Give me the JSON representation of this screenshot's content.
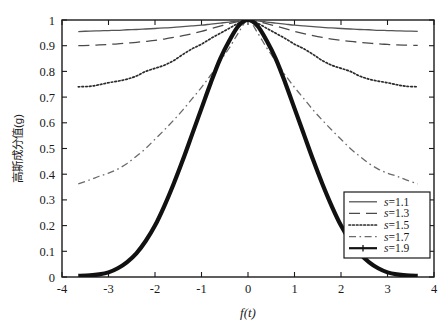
{
  "chart_data": {
    "type": "line",
    "title": "",
    "xlabel": "f(t)",
    "ylabel": "高斯成分值(g)",
    "xlim": [
      -4,
      4
    ],
    "ylim": [
      0,
      1
    ],
    "xticks": [
      "-4",
      "-3",
      "-2",
      "-1",
      "0",
      "1",
      "2",
      "3",
      "4"
    ],
    "xtick_values": [
      -4,
      -3,
      -2,
      -1,
      0,
      1,
      2,
      3,
      4
    ],
    "yticks": [
      "0",
      "0.1",
      "0.2",
      "0.3",
      "0.4",
      "0.5",
      "0.6",
      "0.7",
      "0.8",
      "0.9",
      "1"
    ],
    "ytick_values": [
      0,
      0.1,
      0.2,
      0.3,
      0.4,
      0.5,
      0.6,
      0.7,
      0.8,
      0.9,
      1
    ],
    "grid": false,
    "legend_position": "lower-right",
    "x": [
      -3.65,
      -3.4,
      -3.2,
      -3.0,
      -2.8,
      -2.6,
      -2.4,
      -2.2,
      -2.0,
      -1.8,
      -1.6,
      -1.4,
      -1.2,
      -1.0,
      -0.8,
      -0.6,
      -0.4,
      -0.2,
      0.0,
      0.2,
      0.4,
      0.6,
      0.8,
      1.0,
      1.2,
      1.4,
      1.6,
      1.8,
      2.0,
      2.2,
      2.4,
      2.6,
      2.8,
      3.0,
      3.2,
      3.4,
      3.65
    ],
    "series": [
      {
        "name": "s=1.1",
        "label": "s=1.1",
        "style": "solid",
        "color": "#555555",
        "width": 1.3,
        "values": [
          0.955,
          0.957,
          0.958,
          0.959,
          0.96,
          0.962,
          0.963,
          0.965,
          0.967,
          0.969,
          0.971,
          0.974,
          0.977,
          0.98,
          0.984,
          0.988,
          0.992,
          0.997,
          1.0,
          0.997,
          0.992,
          0.988,
          0.984,
          0.98,
          0.977,
          0.974,
          0.971,
          0.969,
          0.967,
          0.965,
          0.963,
          0.962,
          0.96,
          0.959,
          0.958,
          0.957,
          0.956
        ]
      },
      {
        "name": "s=1.3",
        "label": "s=1.3",
        "style": "dashed",
        "color": "#4a4a4a",
        "width": 1.3,
        "values": [
          0.9,
          0.901,
          0.903,
          0.905,
          0.907,
          0.91,
          0.913,
          0.917,
          0.921,
          0.926,
          0.932,
          0.939,
          0.947,
          0.956,
          0.966,
          0.976,
          0.986,
          0.995,
          1.0,
          0.995,
          0.986,
          0.976,
          0.966,
          0.956,
          0.947,
          0.939,
          0.932,
          0.926,
          0.921,
          0.917,
          0.913,
          0.91,
          0.907,
          0.905,
          0.903,
          0.902,
          0.901
        ]
      },
      {
        "name": "s=1.5",
        "label": "s=1.5",
        "style": "dotted",
        "color": "#2b2b2b",
        "width": 1.7,
        "values": [
          0.74,
          0.742,
          0.748,
          0.756,
          0.762,
          0.77,
          0.782,
          0.8,
          0.812,
          0.824,
          0.842,
          0.866,
          0.888,
          0.906,
          0.928,
          0.948,
          0.968,
          0.988,
          1.0,
          0.988,
          0.968,
          0.948,
          0.928,
          0.906,
          0.888,
          0.866,
          0.842,
          0.824,
          0.812,
          0.8,
          0.782,
          0.77,
          0.762,
          0.756,
          0.748,
          0.742,
          0.74
        ]
      },
      {
        "name": "s=1.7",
        "label": "s=1.7",
        "style": "dashdot",
        "color": "#6a6a6a",
        "width": 1.3,
        "values": [
          0.362,
          0.378,
          0.392,
          0.404,
          0.42,
          0.442,
          0.47,
          0.5,
          0.536,
          0.572,
          0.61,
          0.65,
          0.694,
          0.738,
          0.786,
          0.84,
          0.892,
          0.952,
          1.0,
          0.952,
          0.892,
          0.84,
          0.786,
          0.738,
          0.694,
          0.65,
          0.61,
          0.572,
          0.536,
          0.5,
          0.47,
          0.442,
          0.42,
          0.404,
          0.392,
          0.378,
          0.362
        ]
      },
      {
        "name": "s=1.9",
        "label": "s=1.9",
        "style": "solid-thick-plus",
        "color": "#111111",
        "width": 4.2,
        "values": [
          0.004,
          0.006,
          0.01,
          0.018,
          0.034,
          0.058,
          0.092,
          0.14,
          0.2,
          0.276,
          0.362,
          0.456,
          0.556,
          0.656,
          0.756,
          0.848,
          0.92,
          0.978,
          1.0,
          0.978,
          0.92,
          0.848,
          0.756,
          0.656,
          0.556,
          0.456,
          0.362,
          0.276,
          0.2,
          0.14,
          0.092,
          0.058,
          0.034,
          0.018,
          0.01,
          0.006,
          0.004
        ]
      }
    ]
  },
  "axis": {
    "x_title": "f(t)",
    "y_title": "高斯成分值(g)"
  },
  "legend": {
    "items": [
      {
        "label": "s=1.1",
        "var": "s",
        "eq": "=1.1"
      },
      {
        "label": "s=1.3",
        "var": "s",
        "eq": "=1.3"
      },
      {
        "label": "s=1.5",
        "var": "s",
        "eq": "=1.5"
      },
      {
        "label": "s=1.7",
        "var": "s",
        "eq": "=1.7"
      },
      {
        "label": "s=1.9",
        "var": "s",
        "eq": "=1.9"
      }
    ]
  },
  "caption": {
    "ghost_text": ""
  }
}
